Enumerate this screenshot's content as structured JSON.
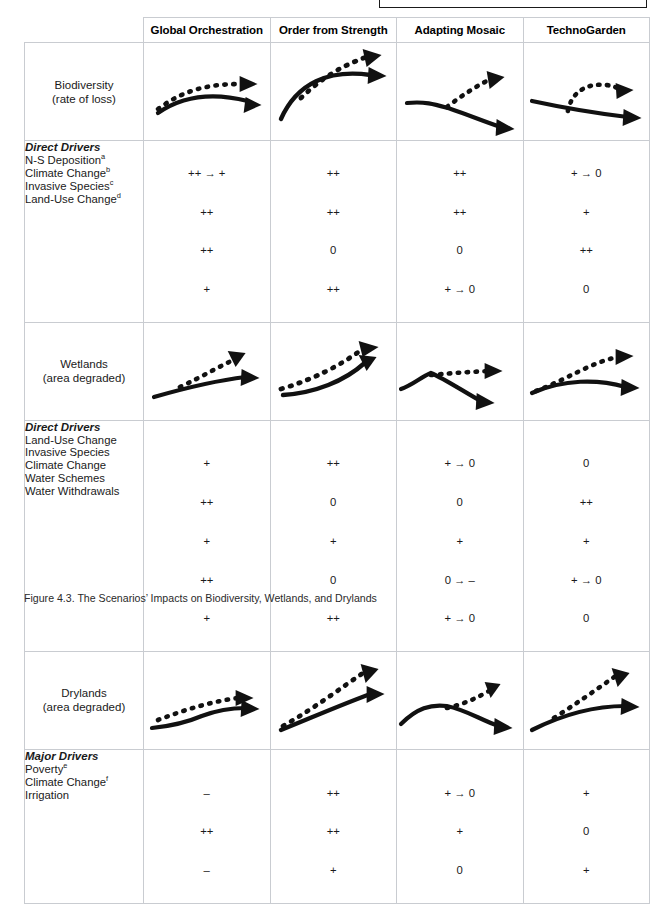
{
  "figure": {
    "caption": "Figure 4.3. The Scenarios’ Impacts on Biodiversity, Wetlands, and Drylands"
  },
  "table": {
    "corner_label": "",
    "scenarios": [
      "Global Orchestration",
      "Order from Strength",
      "Adapting Mosaic",
      "TechnoGarden"
    ],
    "sections": [
      {
        "id": "biodiversity",
        "row_label_line1": "Biodiversity",
        "row_label_line2": "(rate of loss)",
        "drivers_heading": "Direct Drivers",
        "drivers": [
          {
            "name": "N-S Deposition",
            "note": "a"
          },
          {
            "name": "Climate Change",
            "note": "b"
          },
          {
            "name": "Invasive Species",
            "note": "c"
          },
          {
            "name": "Land-Use Change",
            "note": "d"
          }
        ],
        "values": {
          "Global Orchestration": [
            "++ → +",
            "++",
            "++",
            "+"
          ],
          "Order from Strength": [
            "++",
            "++",
            "0",
            "++"
          ],
          "Adapting Mosaic": [
            "++",
            "++",
            "0",
            "+ → 0"
          ],
          "TechnoGarden": [
            "+ → 0",
            "+",
            "++",
            "0"
          ]
        },
        "values_aligned_to_heading": true,
        "charts": {
          "Global Orchestration": {
            "solid": "rise-then-fall-shallow",
            "dashed": "rise-flatten"
          },
          "Order from Strength": {
            "solid": "steep-rise-plateau",
            "dashed": "steep-rise-continue"
          },
          "Adapting Mosaic": {
            "solid": "flat-then-decline",
            "dashed": "flat-then-rise"
          },
          "TechnoGarden": {
            "solid": "gentle-decline",
            "dashed": "hump-then-flat"
          }
        }
      },
      {
        "id": "wetlands",
        "row_label_line1": "Wetlands",
        "row_label_line2": "(area degraded)",
        "drivers_heading": "Direct Drivers",
        "drivers": [
          {
            "name": "Land-Use Change",
            "note": ""
          },
          {
            "name": "Invasive Species",
            "note": ""
          },
          {
            "name": "Climate Change",
            "note": ""
          },
          {
            "name": "Water Schemes",
            "note": ""
          },
          {
            "name": "Water Withdrawals",
            "note": ""
          }
        ],
        "values": {
          "Global Orchestration": [
            "+",
            "++",
            "+",
            "++",
            "+"
          ],
          "Order from Strength": [
            "++",
            "0",
            "+",
            "0",
            "++"
          ],
          "Adapting Mosaic": [
            "+ → 0",
            "0",
            "+",
            "0 → –",
            "+ → 0"
          ],
          "TechnoGarden": [
            "0",
            "++",
            "+",
            "+ → 0",
            "0"
          ]
        },
        "values_aligned_to_heading": false,
        "charts": {
          "Global Orchestration": {
            "solid": "gentle-rise",
            "dashed": "rise-steeper"
          },
          "Order from Strength": {
            "solid": "concave-rise",
            "dashed": "rise-above"
          },
          "Adapting Mosaic": {
            "solid": "peak-then-decline",
            "dashed": "peak-then-flat"
          },
          "TechnoGarden": {
            "solid": "rise-then-flat",
            "dashed": "rise-plateau-high"
          }
        }
      },
      {
        "id": "drylands",
        "row_label_line1": "Drylands",
        "row_label_line2": "(area degraded)",
        "drivers_heading": "Major Drivers",
        "drivers": [
          {
            "name": "Poverty",
            "note": "e"
          },
          {
            "name": "Climate Change",
            "note": "f"
          },
          {
            "name": "Irrigation",
            "note": ""
          }
        ],
        "values": {
          "Global Orchestration": [
            "–",
            "++",
            "–"
          ],
          "Order from Strength": [
            "++",
            "++",
            "+"
          ],
          "Adapting Mosaic": [
            "+ → 0",
            "+",
            "0"
          ],
          "TechnoGarden": [
            "+",
            "0",
            "+"
          ]
        },
        "values_aligned_to_heading": false,
        "charts": {
          "Global Orchestration": {
            "solid": "slow-rise-step",
            "dashed": "rise-above-flatten"
          },
          "Order from Strength": {
            "solid": "linear-rise",
            "dashed": "steeper-linear-rise"
          },
          "Adapting Mosaic": {
            "solid": "hump-then-decline",
            "dashed": "hump-then-rise"
          },
          "TechnoGarden": {
            "solid": "moderate-rise",
            "dashed": "steep-rise"
          }
        }
      }
    ]
  },
  "legend": {
    "symbol_plus_plus": "++",
    "symbol_plus": "+",
    "symbol_zero": "0",
    "symbol_minus": "–",
    "symbol_arrow": "→"
  },
  "style": {
    "line_color": "#111111",
    "grid_color": "#c9ccd1",
    "background": "#ffffff"
  }
}
